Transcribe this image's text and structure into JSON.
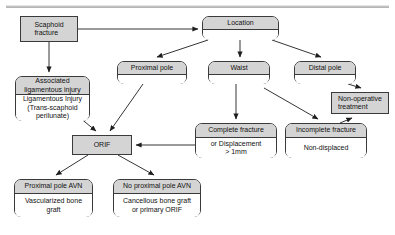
{
  "diagram": {
    "style": {
      "fill_gray": "#d4d4d4",
      "fill_white": "#ffffff",
      "stroke": "#3a3a3a",
      "text": "#111111"
    },
    "nodes": [
      {
        "id": "scaphoid-fracture",
        "shape": "rect-solid",
        "header": "Scaphoid\nfracture",
        "body": "",
        "x": 20,
        "y": 16,
        "w": 58,
        "h": 26
      },
      {
        "id": "location",
        "shape": "rounded-split",
        "header": "Location",
        "body": "",
        "x": 202,
        "y": 16,
        "w": 77,
        "h": 24,
        "header_h": 13
      },
      {
        "id": "proximal-pole",
        "shape": "rounded-split",
        "header": "Proximal pole",
        "body": "",
        "x": 117,
        "y": 61,
        "w": 70,
        "h": 23,
        "header_h": 13
      },
      {
        "id": "waist",
        "shape": "rounded-split",
        "header": "Waist",
        "body": "",
        "x": 208,
        "y": 61,
        "w": 62,
        "h": 23,
        "header_h": 13
      },
      {
        "id": "distal-pole",
        "shape": "rounded-split",
        "header": "Distal pole",
        "body": "",
        "x": 294,
        "y": 61,
        "w": 62,
        "h": 23,
        "header_h": 13
      },
      {
        "id": "non-operative-treatment",
        "shape": "rect-solid",
        "header": "Non-operative\ntreatment",
        "body": "",
        "x": 331,
        "y": 92,
        "w": 58,
        "h": 22
      },
      {
        "id": "associated-ligamentous-injury",
        "shape": "rounded-split",
        "header": "Associated\nligamentous injury",
        "body": "Ligamentous Injury\n(Trans-scaphoid\nperilunate)",
        "x": 15,
        "y": 76,
        "w": 75,
        "h": 45,
        "header_h": 18
      },
      {
        "id": "complete-fracture",
        "shape": "rounded-split",
        "header": "Complete fracture",
        "body": "or Displacement\n> 1mm",
        "x": 195,
        "y": 123,
        "w": 82,
        "h": 35,
        "header_h": 14
      },
      {
        "id": "incomplete-fracture",
        "shape": "rounded-split",
        "header": "Incomplete fracture",
        "body": "Non-displaced",
        "x": 285,
        "y": 123,
        "w": 82,
        "h": 35,
        "header_h": 14
      },
      {
        "id": "orif",
        "shape": "rect-solid",
        "header": "ORIF",
        "body": "",
        "x": 72,
        "y": 135,
        "w": 60,
        "h": 20
      },
      {
        "id": "proximal-pole-avn",
        "shape": "rounded-split",
        "header": "Proximal pole AVN",
        "body": "Vascularized bone\ngraft",
        "x": 14,
        "y": 179,
        "w": 79,
        "h": 38,
        "header_h": 14
      },
      {
        "id": "no-proximal-pole-avn",
        "shape": "rounded-split",
        "header": "No proximal pole AVN",
        "body": "Cancellous bone graft\nor primary ORIF",
        "x": 113,
        "y": 179,
        "w": 88,
        "h": 38,
        "header_h": 14
      }
    ],
    "edges": [
      {
        "id": "scaphoid-to-location",
        "from": "scaphoid-fracture",
        "to": "location"
      },
      {
        "id": "scaphoid-to-associated",
        "from": "scaphoid-fracture",
        "to": "associated-ligamentous-injury"
      },
      {
        "id": "location-to-proximal-pole",
        "from": "location",
        "to": "proximal-pole"
      },
      {
        "id": "location-to-waist",
        "from": "location",
        "to": "waist"
      },
      {
        "id": "location-to-distal-pole",
        "from": "location",
        "to": "distal-pole"
      },
      {
        "id": "distal-pole-to-non-operative",
        "from": "distal-pole",
        "to": "non-operative-treatment"
      },
      {
        "id": "proximal-pole-to-orif",
        "from": "proximal-pole",
        "to": "orif"
      },
      {
        "id": "associated-to-orif",
        "from": "associated-ligamentous-injury",
        "to": "orif"
      },
      {
        "id": "waist-to-complete-fracture",
        "from": "waist",
        "to": "complete-fracture"
      },
      {
        "id": "waist-to-incomplete-fracture",
        "from": "waist",
        "to": "incomplete-fracture"
      },
      {
        "id": "incomplete-to-non-operative",
        "from": "incomplete-fracture",
        "to": "non-operative-treatment"
      },
      {
        "id": "complete-fracture-to-orif",
        "from": "complete-fracture",
        "to": "orif"
      },
      {
        "id": "orif-to-proximal-pole-avn",
        "from": "orif",
        "to": "proximal-pole-avn"
      },
      {
        "id": "orif-to-no-proximal-pole-avn",
        "from": "orif",
        "to": "no-proximal-pole-avn"
      }
    ]
  }
}
